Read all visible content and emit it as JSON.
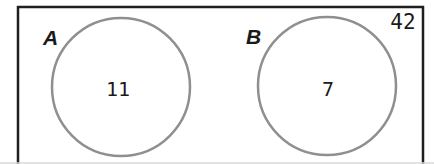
{
  "diagram": {
    "type": "venn-disjoint-sets",
    "sets": [
      {
        "label": "A",
        "value": "11"
      },
      {
        "label": "B",
        "value": "7"
      }
    ],
    "outside_value": "42",
    "colors": {
      "rect_border": "#1f1f1f",
      "circle_stroke": "#8f8f8f",
      "text": "#1a1a1a",
      "background": "#ffffff"
    }
  }
}
